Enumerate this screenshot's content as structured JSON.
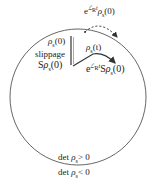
{
  "diagram": {
    "type": "state-space-sketch",
    "region": "circle",
    "labels": {
      "top_dashed": {
        "prefix": "e",
        "exponent": "ℒ",
        "exp_sub": "R",
        "exp_t": "t",
        "body": "ρ",
        "body_sub": "s",
        "arg": "(0)"
      },
      "rho_s0": {
        "body": "ρ",
        "body_sub": "s",
        "arg": "(0)"
      },
      "slippage": "slippage",
      "S_rho_s0": {
        "prefix": "S",
        "body": "ρ",
        "body_sub": "s",
        "arg": "(0)"
      },
      "rho_s_t": {
        "body": "ρ",
        "body_sub": "s",
        "arg": "(t)"
      },
      "bottom_evolved": {
        "prefix": "e",
        "exponent": "ℒ",
        "exp_sub": "R",
        "exp_t": "t",
        "S": "S",
        "body": "ρ",
        "body_sub": "s",
        "arg": "(0)"
      },
      "det_positive": {
        "text": "det",
        "body": "ρ",
        "body_sub": "s",
        "rel": "> 0"
      },
      "det_negative": {
        "text": "det",
        "body": "ρ",
        "body_sub": "s",
        "rel": "< 0"
      }
    },
    "colors": {
      "stroke": "#333333",
      "background": "#ffffff"
    }
  }
}
